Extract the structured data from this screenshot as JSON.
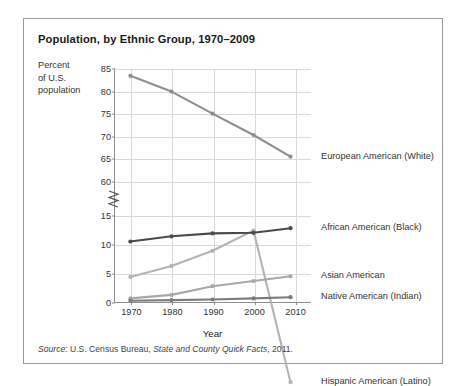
{
  "chart_data": {
    "type": "line",
    "title": "Population, by Ethnic Group, 1970–2009",
    "xlabel": "Year",
    "ylabel": "Percent of U.S. population",
    "ylabel_lines": [
      "Percent",
      "of U.S.",
      "population"
    ],
    "x": [
      1970,
      1980,
      1990,
      2000,
      2009
    ],
    "xlim": [
      1966,
      2014
    ],
    "xticks": [
      "1970",
      "1980",
      "1990",
      "2000",
      "2010"
    ],
    "xtick_values": [
      1970,
      1980,
      1990,
      2000,
      2010
    ],
    "yticks": [
      "0",
      "5",
      "10",
      "15",
      "60",
      "65",
      "70",
      "75",
      "80",
      "85"
    ],
    "ytick_values": [
      0,
      5,
      10,
      15,
      60,
      65,
      70,
      75,
      80,
      85
    ],
    "axis_break": true,
    "axis_break_between": [
      15,
      60
    ],
    "grid": true,
    "legend": "right-of-line-endpoints",
    "series": [
      {
        "name": "European American (White)",
        "color": "#8f8f8f",
        "values": [
          83.5,
          80.0,
          75.1,
          70.4,
          65.6
        ],
        "label_y": 65.6
      },
      {
        "name": "Hispanic American (Latino)",
        "color": "#b4b4b4",
        "values": [
          4.5,
          6.4,
          9.0,
          12.5,
          15.7
        ],
        "label_y": 15.7
      },
      {
        "name": "African American (Black)",
        "color": "#4a4a4a",
        "values": [
          10.6,
          11.5,
          12.0,
          12.1,
          12.9
        ],
        "label_y": 12.9
      },
      {
        "name": "Asian American",
        "color": "#a8a8a8",
        "values": [
          0.8,
          1.4,
          2.9,
          3.8,
          4.6
        ],
        "label_y": 4.6
      },
      {
        "name": "Native American (Indian)",
        "color": "#7c7c7c",
        "values": [
          0.4,
          0.5,
          0.6,
          0.8,
          1.0
        ],
        "label_y": 1.0
      }
    ],
    "source": {
      "prefix": "Source:",
      "text_before": " U.S. Census Bureau, ",
      "italic": "State and County Quick Facts",
      "text_after": ", 2011."
    }
  }
}
